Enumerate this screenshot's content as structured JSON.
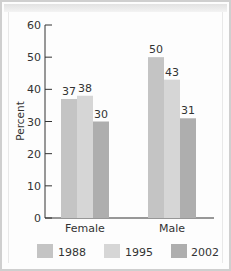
{
  "chart_data": {
    "type": "bar",
    "title": "",
    "xlabel": "",
    "ylabel": "Percent",
    "ylim": [
      0,
      60
    ],
    "yticks": [
      0,
      10,
      20,
      30,
      40,
      50,
      60
    ],
    "grid": false,
    "legend_position": "bottom",
    "categories": [
      "Female",
      "Male"
    ],
    "series": [
      {
        "name": "1988",
        "values": [
          37,
          50
        ],
        "color": "#c4c4c4"
      },
      {
        "name": "1995",
        "values": [
          38,
          43
        ],
        "color": "#d6d6d6"
      },
      {
        "name": "2002",
        "values": [
          30,
          31
        ],
        "color": "#aeaeae"
      }
    ],
    "data_labels": [
      [
        "37",
        "50"
      ],
      [
        "38",
        "43"
      ],
      [
        "30",
        "31"
      ]
    ]
  },
  "axis": {
    "ylabel": "Percent",
    "yticks": [
      "0",
      "10",
      "20",
      "30",
      "40",
      "50",
      "60"
    ]
  },
  "categories": [
    "Female",
    "Male"
  ],
  "legend": [
    "1988",
    "1995",
    "2002"
  ]
}
